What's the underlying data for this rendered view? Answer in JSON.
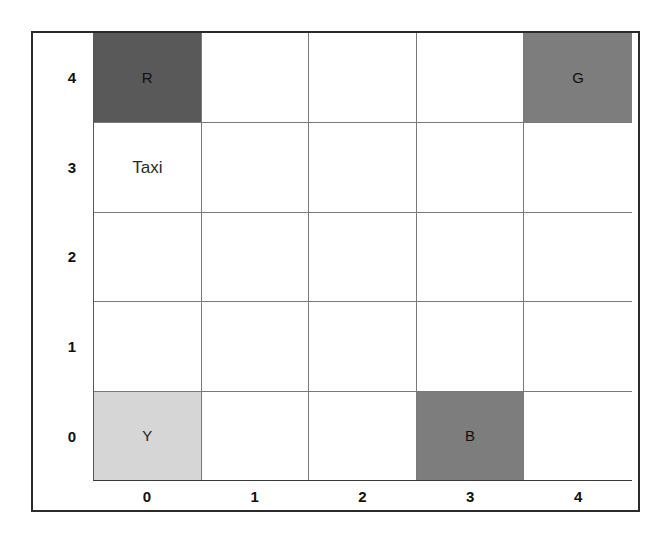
{
  "figure": {
    "type": "taxi-grid-world",
    "frame": {
      "border_color": "#2b2b2b"
    },
    "grid": {
      "columns": 5,
      "rows": 5,
      "line_color": "#7a7a7a",
      "background": "#ffffff"
    },
    "shades": {
      "dark": "#595959",
      "medium": "#7d7d7d",
      "light": "#d6d6d6"
    }
  },
  "axes": {
    "x_labels": [
      "0",
      "1",
      "2",
      "3",
      "4"
    ],
    "y_labels": [
      "4",
      "3",
      "2",
      "1",
      "0"
    ]
  },
  "locations": [
    {
      "id": "R",
      "label": "R",
      "col": 0,
      "row": 4,
      "shade": "dark",
      "color": "#595959"
    },
    {
      "id": "G",
      "label": "G",
      "col": 4,
      "row": 4,
      "shade": "medium",
      "color": "#7d7d7d"
    },
    {
      "id": "Y",
      "label": "Y",
      "col": 0,
      "row": 0,
      "shade": "light",
      "color": "#d6d6d6"
    },
    {
      "id": "B",
      "label": "B",
      "col": 3,
      "row": 0,
      "shade": "medium",
      "color": "#7d7d7d"
    }
  ],
  "agent": {
    "label": "Taxi",
    "col": 0,
    "row": 3
  },
  "cells": [
    [
      {
        "label": "R",
        "shade": "dark",
        "kind": "location"
      },
      {
        "label": "",
        "shade": "none",
        "kind": "empty"
      },
      {
        "label": "",
        "shade": "none",
        "kind": "empty"
      },
      {
        "label": "",
        "shade": "none",
        "kind": "empty"
      },
      {
        "label": "G",
        "shade": "medium",
        "kind": "location"
      }
    ],
    [
      {
        "label": "Taxi",
        "shade": "none",
        "kind": "agent"
      },
      {
        "label": "",
        "shade": "none",
        "kind": "empty"
      },
      {
        "label": "",
        "shade": "none",
        "kind": "empty"
      },
      {
        "label": "",
        "shade": "none",
        "kind": "empty"
      },
      {
        "label": "",
        "shade": "none",
        "kind": "empty"
      }
    ],
    [
      {
        "label": "",
        "shade": "none",
        "kind": "empty"
      },
      {
        "label": "",
        "shade": "none",
        "kind": "empty"
      },
      {
        "label": "",
        "shade": "none",
        "kind": "empty"
      },
      {
        "label": "",
        "shade": "none",
        "kind": "empty"
      },
      {
        "label": "",
        "shade": "none",
        "kind": "empty"
      }
    ],
    [
      {
        "label": "",
        "shade": "none",
        "kind": "empty"
      },
      {
        "label": "",
        "shade": "none",
        "kind": "empty"
      },
      {
        "label": "",
        "shade": "none",
        "kind": "empty"
      },
      {
        "label": "",
        "shade": "none",
        "kind": "empty"
      },
      {
        "label": "",
        "shade": "none",
        "kind": "empty"
      }
    ],
    [
      {
        "label": "Y",
        "shade": "light",
        "kind": "location"
      },
      {
        "label": "",
        "shade": "none",
        "kind": "empty"
      },
      {
        "label": "",
        "shade": "none",
        "kind": "empty"
      },
      {
        "label": "B",
        "shade": "medium",
        "kind": "location"
      },
      {
        "label": "",
        "shade": "none",
        "kind": "empty"
      }
    ]
  ]
}
